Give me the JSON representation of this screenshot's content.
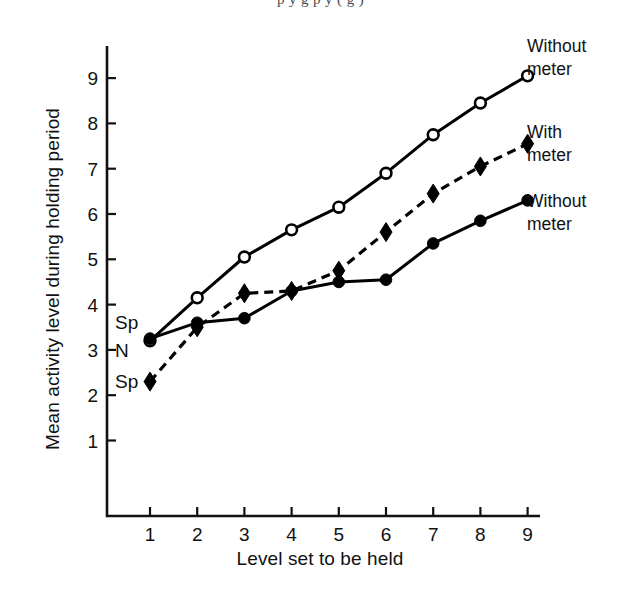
{
  "page": {
    "top_cut_text": "p          y  g      p    y  ( g     )"
  },
  "chart": {
    "xlabel": "Level set to be held",
    "ylabel": "Mean activity level during holding period",
    "x_ticks": [
      "1",
      "2",
      "3",
      "4",
      "5",
      "6",
      "7",
      "8",
      "9"
    ],
    "y_ticks": [
      "1",
      "2",
      "3",
      "4",
      "5",
      "6",
      "7",
      "8",
      "9"
    ],
    "annotations": [
      {
        "text": "Sp",
        "x": 1,
        "y": 3.62
      },
      {
        "text": "N",
        "x": 1,
        "y": 3.0
      },
      {
        "text": "Sp",
        "x": 1,
        "y": 2.32
      }
    ],
    "legend": [
      {
        "label_line1": "Without",
        "label_line2": "meter",
        "marker": "open-circle",
        "line": "solid"
      },
      {
        "label_line1": "With",
        "label_line2": "meter",
        "marker": "filled-diamond",
        "line": "dashed"
      },
      {
        "label_line1": "Without",
        "label_line2": "meter",
        "marker": "filled-circle",
        "line": "solid"
      }
    ]
  },
  "chart_data": {
    "type": "line",
    "title": "",
    "xlabel": "Level set to be held",
    "ylabel": "Mean activity level during holding period",
    "xlim": [
      0.45,
      9.55
    ],
    "ylim": [
      0.5,
      9.7
    ],
    "xticks": [
      1,
      2,
      3,
      4,
      5,
      6,
      7,
      8,
      9
    ],
    "yticks": [
      1,
      2,
      3,
      4,
      5,
      6,
      7,
      8,
      9
    ],
    "grid": false,
    "legend_position": "right-of-plot",
    "x": [
      1,
      2,
      3,
      4,
      5,
      6,
      7,
      8,
      9
    ],
    "series": [
      {
        "name": "Without meter",
        "legend_label": "Without meter",
        "marker": "open-circle",
        "linestyle": "solid",
        "color": "#000000",
        "values": [
          3.2,
          4.15,
          5.05,
          5.65,
          6.15,
          6.9,
          7.75,
          8.45,
          9.05
        ]
      },
      {
        "name": "With meter",
        "legend_label": "With meter",
        "marker": "filled-diamond",
        "linestyle": "dashed",
        "color": "#000000",
        "values": [
          2.3,
          3.5,
          4.25,
          4.3,
          4.75,
          5.6,
          6.45,
          7.05,
          7.55
        ]
      },
      {
        "name": "Without meter (lower)",
        "legend_label": "Without meter",
        "marker": "filled-circle",
        "linestyle": "solid",
        "color": "#000000",
        "values": [
          3.25,
          3.6,
          3.7,
          4.3,
          4.5,
          4.55,
          5.35,
          5.85,
          6.3
        ]
      }
    ],
    "annotations": [
      {
        "text": "Sp",
        "note": "upper axis label near y=3.6"
      },
      {
        "text": "N",
        "note": "axis label near y=3.0"
      },
      {
        "text": "Sp",
        "note": "lower axis label near y=2.3"
      }
    ]
  }
}
